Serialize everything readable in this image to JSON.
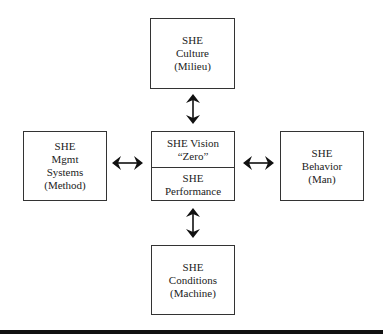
{
  "diagram": {
    "top": {
      "lines": [
        "SHE",
        "Culture",
        "(Milieu)"
      ]
    },
    "left": {
      "lines": [
        "SHE",
        "Mgmt",
        "Systems",
        "(Method)"
      ]
    },
    "right": {
      "lines": [
        "SHE",
        "Behavior",
        "(Man)"
      ]
    },
    "bottom": {
      "lines": [
        "SHE",
        "Conditions",
        "(Machine)"
      ]
    },
    "center": {
      "upper": [
        "SHE Vision",
        "“Zero”"
      ],
      "lower": [
        "SHE",
        "Performance"
      ]
    },
    "arrows": [
      "top-center",
      "left-center",
      "right-center",
      "bottom-center"
    ],
    "arrow_type": "bidirectional"
  }
}
